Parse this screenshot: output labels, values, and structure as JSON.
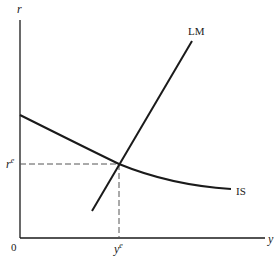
{
  "diagram": {
    "type": "IS-LM",
    "axes": {
      "y_axis_label": "r",
      "x_axis_label": "y",
      "origin_label": "0"
    },
    "curves": [
      {
        "name": "LM",
        "label": "LM",
        "shape": "upward-sloping line"
      },
      {
        "name": "IS",
        "label": "IS",
        "shape": "downward-sloping convex curve"
      }
    ],
    "equilibrium": {
      "r_label_base": "r",
      "r_label_sup": "e",
      "y_label_base": "y",
      "y_label_sup": "e"
    },
    "colors": {
      "line": "#1a1a1a",
      "dashed": "#555555",
      "background": "#ffffff"
    }
  }
}
